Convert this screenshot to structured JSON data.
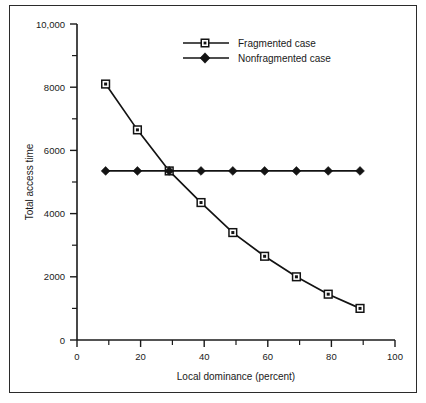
{
  "figure": {
    "border_color": "#2b2b2b",
    "background": "#ffffff",
    "line_color": "#131313"
  },
  "chart_data": {
    "type": "line",
    "title": "",
    "subtitle": "",
    "xlabel": "Local dominance (percent)",
    "ylabel": "Total access time",
    "xlim": [
      0,
      100
    ],
    "ylim": [
      0,
      10000
    ],
    "grid": false,
    "legend_position": "top-center",
    "x_ticks": [
      0,
      20,
      40,
      60,
      80,
      100
    ],
    "x_ticklabels": [
      "0",
      "20",
      "40",
      "60",
      "80",
      "100"
    ],
    "x_minor_ticks": [
      10,
      30,
      50,
      70,
      90
    ],
    "y_ticks": [
      0,
      2000,
      4000,
      6000,
      8000,
      10000
    ],
    "y_ticklabels": [
      "0",
      "2000",
      "4000",
      "6000",
      "8000",
      "10,000"
    ],
    "y_minor_ticks": [
      1000,
      3000,
      5000,
      7000,
      9000
    ],
    "x": [
      9,
      19,
      29,
      39,
      49,
      59,
      69,
      79,
      89
    ],
    "series": [
      {
        "name": "Fragmented case",
        "marker": "square-dot",
        "values": [
          8100,
          6650,
          5350,
          4350,
          3400,
          2650,
          2000,
          1450,
          1000
        ]
      },
      {
        "name": "Nonfragmented case",
        "marker": "diamond",
        "values": [
          5350,
          5350,
          5350,
          5350,
          5350,
          5350,
          5350,
          5350,
          5350
        ]
      }
    ]
  },
  "legend": {
    "entries": [
      {
        "label": "Fragmented case"
      },
      {
        "label": "Nonfragmented case"
      }
    ]
  }
}
